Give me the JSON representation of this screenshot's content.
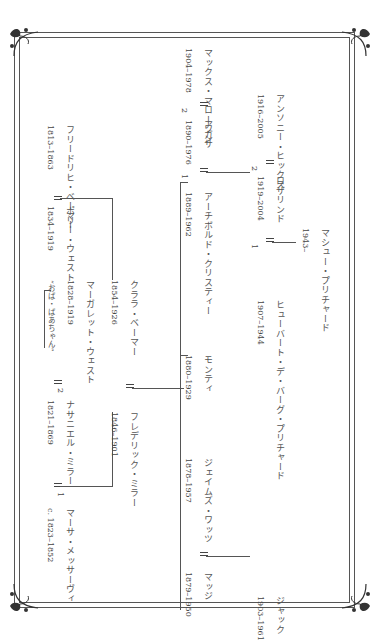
{
  "orientation": "rotated-90-clockwise",
  "colors": {
    "line": "#555555",
    "text": "#4a4a4a",
    "background": "#ffffff"
  },
  "frame": {
    "style": "double-line",
    "corner_ornament": "fleuron-icon"
  },
  "people": {
    "martha": {
      "name": "マーサ・メッサーヴィ",
      "years": "c. 1823–1852"
    },
    "nathaniel": {
      "name": "ナサニエル・ミラー",
      "years": "1821–1869"
    },
    "margaret": {
      "name": "マーガレット・ウェスト",
      "years": "1828–1919",
      "note": "“おば・ばあちゃん”"
    },
    "polly": {
      "name": "ポリー・ウェスト",
      "years": "1834–1919"
    },
    "friedrich": {
      "name": "フリードリヒ・ベーマー",
      "years": "1813–1863"
    },
    "frederick": {
      "name": "フレデリック・ミラー",
      "years": "1846–1901"
    },
    "clara": {
      "name": "クララ・ベーマー",
      "years": "1854–1926"
    },
    "madge": {
      "name": "マッジ",
      "years": "1879–1950"
    },
    "james": {
      "name": "ジェイムズ・ワッツ",
      "years": "1878–1957"
    },
    "jack": {
      "name": "ジャック",
      "years": "1903–1961"
    },
    "monty": {
      "name": "モンティ",
      "years": "1880–1929"
    },
    "agatha": {
      "name": "アガサ",
      "years": "1890–1976"
    },
    "archibald": {
      "name": "アーチボルド・クリスティー",
      "years": "1889–1962"
    },
    "max": {
      "name": "マックス・マローワン",
      "years": "1904–1978"
    },
    "hubert": {
      "name": "ヒューバート・デ・バーグ・プリチャード",
      "years": "1907–1944"
    },
    "rosalind": {
      "name": "ロザリンド",
      "years": "1919–2004"
    },
    "anthony": {
      "name": "アンソニー・ヒックス",
      "years": "1916–2005"
    },
    "mathew": {
      "name": "マシュー・プリチャード",
      "years": "1943–"
    }
  },
  "marriage_labels": {
    "first": "1",
    "second": "2"
  }
}
